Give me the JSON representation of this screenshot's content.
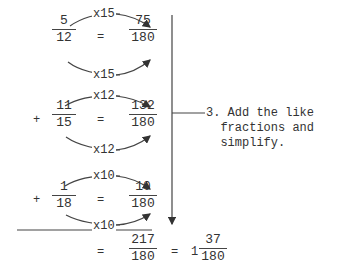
{
  "rows": [
    {
      "sign": "",
      "from": {
        "num": "5",
        "den": "12"
      },
      "eq": "=",
      "to": {
        "num": "75",
        "den": "180"
      },
      "mult_top": "x15",
      "mult_bottom": "x15"
    },
    {
      "sign": "+",
      "from": {
        "num": "11",
        "den": "15"
      },
      "eq": "=",
      "to": {
        "num": "132",
        "den": "180"
      },
      "mult_top": "x12",
      "mult_bottom": "x12"
    },
    {
      "sign": "+",
      "from": {
        "num": "1",
        "den": "18"
      },
      "eq": "=",
      "to": {
        "num": "10",
        "den": "180"
      },
      "mult_top": "x10",
      "mult_bottom": "x10"
    }
  ],
  "result": {
    "eq1": "=",
    "sum": {
      "num": "217",
      "den": "180"
    },
    "eq2": "=",
    "mixed": {
      "whole": "1",
      "num": "37",
      "den": "180"
    }
  },
  "step_note": {
    "line1": "3. Add the like",
    "line2": "fractions and",
    "line3": "simplify."
  }
}
